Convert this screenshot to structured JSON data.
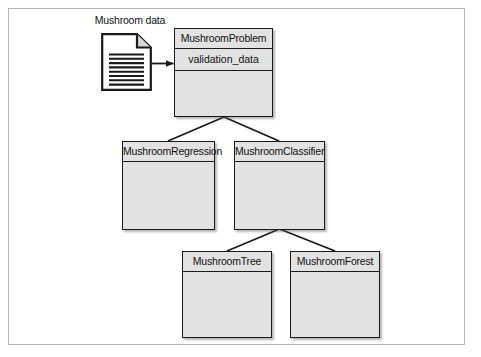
{
  "figure": {
    "kind": "uml-class-diagram",
    "frame": {
      "border_color": "#b4b4b4"
    },
    "palette": {
      "box_fill": "#e2e2e2",
      "box_stroke": "#1a1a1a",
      "line": "#1a1a1a",
      "text": "#111111",
      "background": "#ffffff"
    }
  },
  "data_source": {
    "label": "Mushroom data",
    "icon": "document-icon",
    "line_count": 9
  },
  "classes": [
    {
      "id": "mushroom-problem",
      "name": "MushroomProblem",
      "attributes": [
        "validation_data"
      ],
      "operations": []
    },
    {
      "id": "mushroom-regression",
      "name": "MushroomRegression",
      "attributes": [],
      "operations": []
    },
    {
      "id": "mushroom-classifier",
      "name": "MushroomClassifier",
      "attributes": [],
      "operations": []
    },
    {
      "id": "mushroom-tree",
      "name": "MushroomTree",
      "attributes": [],
      "operations": []
    },
    {
      "id": "mushroom-forest",
      "name": "MushroomForest",
      "attributes": [],
      "operations": []
    }
  ],
  "relations": [
    {
      "type": "data-flow",
      "from": "mushroom-data",
      "to": "mushroom-problem"
    },
    {
      "type": "generalization",
      "from": "mushroom-regression",
      "to": "mushroom-problem"
    },
    {
      "type": "generalization",
      "from": "mushroom-classifier",
      "to": "mushroom-problem"
    },
    {
      "type": "generalization",
      "from": "mushroom-tree",
      "to": "mushroom-classifier"
    },
    {
      "type": "generalization",
      "from": "mushroom-forest",
      "to": "mushroom-classifier"
    }
  ]
}
